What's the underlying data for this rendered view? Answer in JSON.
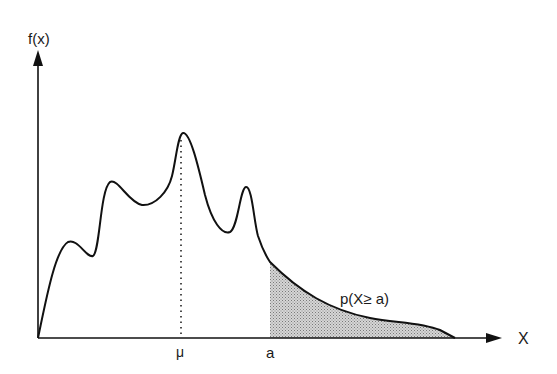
{
  "diagram": {
    "y_axis_label": "f(x)",
    "x_axis_label": "X",
    "mean_label": "μ",
    "threshold_label": "a",
    "area_label": "p(X≥ a)",
    "colors": {
      "line": "#111111",
      "shade": "#bdbdbd",
      "background": "#ffffff"
    }
  }
}
